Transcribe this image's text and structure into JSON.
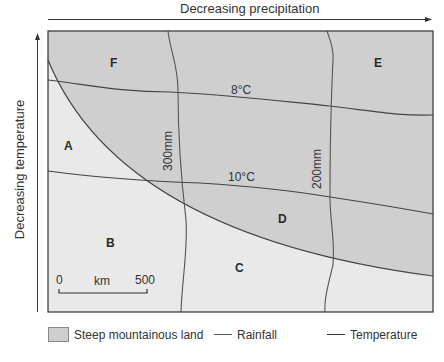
{
  "axes": {
    "x_label": "Decreasing precipitation",
    "y_label": "Decreasing temperature"
  },
  "regions": [
    {
      "id": "A",
      "label": "A"
    },
    {
      "id": "B",
      "label": "B"
    },
    {
      "id": "C",
      "label": "C"
    },
    {
      "id": "D",
      "label": "D"
    },
    {
      "id": "E",
      "label": "E"
    },
    {
      "id": "F",
      "label": "F"
    }
  ],
  "isohyets": [
    {
      "label": "300mm"
    },
    {
      "label": "200mm"
    }
  ],
  "isotherms": [
    {
      "label": "8°C"
    },
    {
      "label": "10°C"
    }
  ],
  "scale_bar": {
    "start": "0",
    "unit": "km",
    "end": "500"
  },
  "legend": {
    "items": [
      {
        "label": "Steep mountainous land"
      },
      {
        "label": "Rainfall"
      },
      {
        "label": "Temperature"
      }
    ]
  },
  "colors": {
    "mountain_fill": "#cfcfcf",
    "lowland_fill": "#e9e9e9",
    "line": "#4a4a4a"
  }
}
